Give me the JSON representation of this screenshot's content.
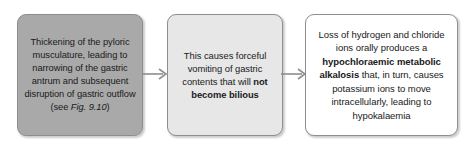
{
  "diagram": {
    "type": "horizontal-flow-chart",
    "colors": {
      "box_1_fill": "#a9a9a9",
      "box_2_fill": "#e7e7e7",
      "box_3_fill": "#ffffff",
      "border": "#8e8e8e",
      "arrow": "#8e8e8e",
      "text": "#1a1a1a",
      "background": "#ffffff"
    },
    "boxes": [
      {
        "id": "box-1",
        "segments": [
          {
            "text": "Thickening of the pyloric musculature, leading to narrowing of the gastric antrum and subsequent disruption of gastric outflow (see ",
            "style": "normal"
          },
          {
            "text": "Fig. 9.10",
            "style": "italic"
          },
          {
            "text": ")",
            "style": "normal"
          }
        ],
        "plain_text": "Thickening of the pyloric musculature, leading to narrowing of the gastric antrum and subsequent disruption of gastric outflow (see Fig. 9.10)"
      },
      {
        "id": "box-2",
        "segments": [
          {
            "text": "This causes forceful vomiting of gastric contents that will ",
            "style": "normal"
          },
          {
            "text": "not become bilious",
            "style": "bold"
          }
        ],
        "plain_text": "This causes forceful vomiting of gastric contents that will not become bilious"
      },
      {
        "id": "box-3",
        "segments": [
          {
            "text": "Loss of hydrogen and chloride ions orally produces a ",
            "style": "normal"
          },
          {
            "text": "hypochloraemic metabolic alkalosis",
            "style": "bold"
          },
          {
            "text": " that, in turn, causes potassium ions to move intracellularly, leading to hypokalaemia",
            "style": "normal"
          }
        ],
        "plain_text": "Loss of hydrogen and chloride ions orally produces a hypochloraemic metabolic alkalosis that, in turn, causes potassium ions to move intracellularly, leading to hypokalaemia"
      }
    ],
    "arrows": [
      {
        "id": "arrow-1",
        "from": "box-1",
        "to": "box-2",
        "direction": "right"
      },
      {
        "id": "arrow-2",
        "from": "box-2",
        "to": "box-3",
        "direction": "right"
      }
    ]
  }
}
